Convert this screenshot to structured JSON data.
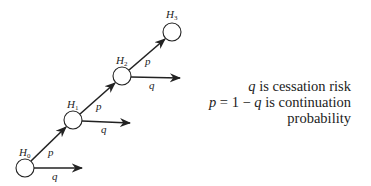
{
  "diagram": {
    "nodes": [
      {
        "id": "H0",
        "label": "H",
        "sub": "0",
        "cx": 25,
        "cy": 168
      },
      {
        "id": "H1",
        "label": "H",
        "sub": "1",
        "cx": 73,
        "cy": 120
      },
      {
        "id": "H2",
        "label": "H",
        "sub": "2",
        "cx": 122,
        "cy": 76
      },
      {
        "id": "H3",
        "label": "H",
        "sub": "3",
        "cx": 172,
        "cy": 32
      }
    ],
    "edge_labels": {
      "continue": "p",
      "cease": "q"
    },
    "legend": {
      "line1_var": "q",
      "line1_text": " is cessation risk",
      "line2_var": "p",
      "line2_mid": " = 1 − ",
      "line2_var2": "q",
      "line2_text": " is continuation",
      "line3_text": "probability"
    }
  }
}
